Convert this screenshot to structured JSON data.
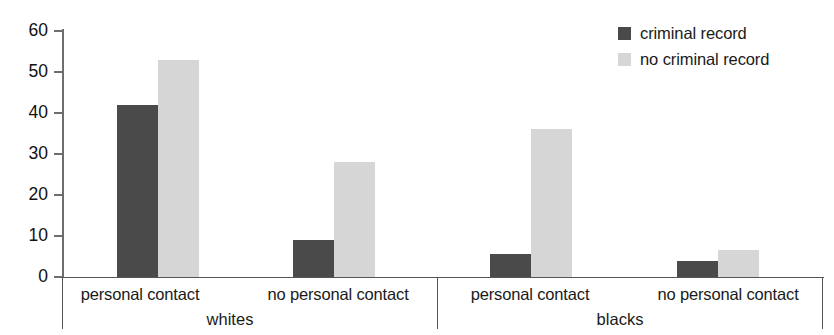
{
  "chart_data": {
    "type": "bar",
    "title": "",
    "subtitle": "",
    "xlabel": "",
    "ylabel": "",
    "ylim": [
      0,
      60
    ],
    "yticks": [
      0,
      10,
      20,
      30,
      40,
      50,
      60
    ],
    "grid": false,
    "legend_position": "top-right",
    "groups": [
      {
        "name": "whites",
        "categories": [
          "personal contact",
          "no personal contact"
        ]
      },
      {
        "name": "blacks",
        "categories": [
          "personal contact",
          "no personal contact"
        ]
      }
    ],
    "categories": [
      "whites / personal contact",
      "whites / no personal contact",
      "blacks / personal contact",
      "blacks / no personal contact"
    ],
    "series": [
      {
        "name": "criminal record",
        "color": "#4a4a4a",
        "values": [
          42,
          9,
          5.5,
          4
        ]
      },
      {
        "name": "no criminal record",
        "color": "#d6d6d6",
        "values": [
          53,
          28,
          36,
          6.5
        ]
      }
    ]
  },
  "legend": {
    "items": [
      {
        "label": "criminal record",
        "color": "#4a4a4a"
      },
      {
        "label": "no criminal record",
        "color": "#d6d6d6"
      }
    ]
  },
  "axis": {
    "y_tick_labels": [
      "60",
      "50",
      "40",
      "30",
      "20",
      "10",
      "0"
    ]
  },
  "labels": {
    "whites_personal_contact": "personal contact",
    "whites_no_personal_contact": "no personal contact",
    "blacks_personal_contact": "personal contact",
    "blacks_no_personal_contact": "no personal contact",
    "group_whites": "whites",
    "group_blacks": "blacks"
  }
}
